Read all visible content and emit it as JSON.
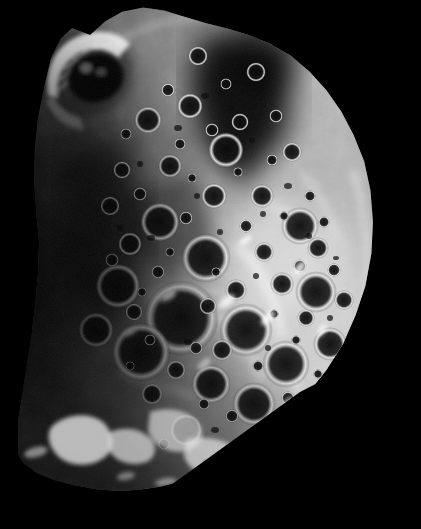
{
  "image": {
    "subject": "Phoebe",
    "subject_type": "moon",
    "scene": "spacecraft close-up of a heavily cratered irregular moon against empty space",
    "background_color": "#000000",
    "width": 421,
    "height": 529,
    "color_mode": "grayscale",
    "lighting": {
      "sun_direction": "from the right",
      "terminator_edge": "left",
      "brightest_region": "right of center",
      "shadow_region": "upper-right interior and left limb"
    },
    "palette": {
      "space": "#000000",
      "deep_shadow": "#070707",
      "dark_regolith": "#2a2a2a",
      "mid_regolith": "#7d7d7d",
      "light_regolith": "#b4b4b4",
      "bright_rim": "#e8e8e8",
      "specular_highlight": "#ffffff"
    },
    "body": {
      "outline_bbox": {
        "x": 30,
        "y": 5,
        "width": 338,
        "height": 485
      },
      "limb_type": "convex bright limb on the right, sharp diagonal cut lower-right",
      "terminator_type": "gradual fade to black along the left edge"
    },
    "features": [
      {
        "name": "bright-rimmed-crater-upper-left",
        "cx": 86,
        "cy": 74,
        "r": 42,
        "note": "large crater with brilliant striated western wall and dark shadowed floor"
      },
      {
        "name": "shadow-wedge-upper-right",
        "cx": 268,
        "cy": 120,
        "r": 58,
        "note": "broad dark shadow wedge in the upper-right interior"
      },
      {
        "name": "central-crater-cluster",
        "cx": 180,
        "cy": 320,
        "r": 70,
        "note": "dense overlapping craters with bright sunlit rims"
      },
      {
        "name": "bright-highland-right-center",
        "cx": 290,
        "cy": 300,
        "r": 75,
        "note": "brightest sunlit highland terrain"
      },
      {
        "name": "fragmented-terminator-patches",
        "cx": 95,
        "cy": 440,
        "r": 60,
        "note": "broken bright patches along the lower-left terminator"
      },
      {
        "name": "limb-horizon-top",
        "cx": 200,
        "cy": 20,
        "r": 120,
        "note": "rough illuminated horizon along the top edge"
      }
    ],
    "crater_count_visible": "approximately 120 resolvable craters"
  }
}
